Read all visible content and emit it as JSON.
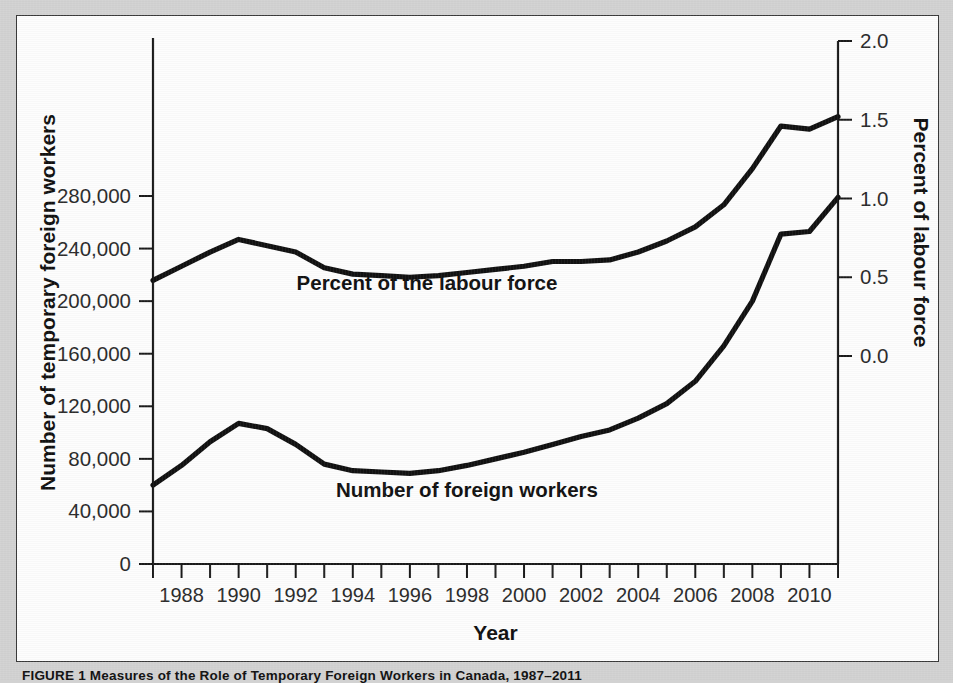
{
  "figure": {
    "caption": "FIGURE 1   Measures of the Role of Temporary Foreign Workers in Canada, 1987–2011"
  },
  "chart_data": {
    "type": "line",
    "title": "",
    "xlabel": "Year",
    "ylabel": "Number of temporary foreign workers",
    "y2label": "Percent of labour force",
    "xlim": [
      1987,
      2011
    ],
    "ylim": [
      0,
      300000
    ],
    "y2lim": [
      -0.5,
      2.0
    ],
    "grid": false,
    "legend": "inline-labels",
    "x": [
      1987,
      1988,
      1989,
      1990,
      1991,
      1992,
      1993,
      1994,
      1995,
      1996,
      1997,
      1998,
      1999,
      2000,
      2001,
      2002,
      2003,
      2004,
      2005,
      2006,
      2007,
      2008,
      2009,
      2010,
      2011
    ],
    "xticks": [
      1987,
      1988,
      1989,
      1990,
      1991,
      1992,
      1993,
      1994,
      1995,
      1996,
      1997,
      1998,
      1999,
      2000,
      2001,
      2002,
      2003,
      2004,
      2005,
      2006,
      2007,
      2008,
      2009,
      2010,
      2011
    ],
    "xtick_labels": [
      "",
      "1988",
      "",
      "1990",
      "",
      "1992",
      "",
      "1994",
      "",
      "1996",
      "",
      "1998",
      "",
      "2000",
      "",
      "2002",
      "",
      "2004",
      "",
      "2006",
      "",
      "2008",
      "",
      "2010",
      ""
    ],
    "yticks": [
      0,
      40000,
      80000,
      120000,
      160000,
      200000,
      240000,
      280000
    ],
    "ytick_labels": [
      "0",
      "40,000",
      "80,000",
      "120,000",
      "160,000",
      "200,000",
      "240,000",
      "280,000"
    ],
    "y2ticks": [
      0.0,
      0.5,
      1.0,
      1.5,
      2.0
    ],
    "y2tick_labels": [
      "0.0",
      "0.5",
      "1.0",
      "1.5",
      "2.0"
    ],
    "series": [
      {
        "name": "Percent of the labour force",
        "axis": "right",
        "label_text": "Percent of the labour force",
        "values": [
          0.48,
          0.57,
          0.66,
          0.74,
          0.7,
          0.66,
          0.56,
          0.52,
          0.51,
          0.5,
          0.51,
          0.53,
          0.55,
          0.57,
          0.6,
          0.6,
          0.61,
          0.66,
          0.73,
          0.82,
          0.96,
          1.19,
          1.46,
          1.44,
          1.52
        ]
      },
      {
        "name": "Number of foreign workers",
        "axis": "left",
        "label_text": "Number of foreign workers",
        "values": [
          60000,
          75000,
          93000,
          107000,
          103000,
          91000,
          76000,
          71000,
          70000,
          69000,
          71000,
          75000,
          80000,
          85000,
          91000,
          97000,
          102000,
          111000,
          122000,
          139000,
          166000,
          200000,
          251000,
          253000,
          279000
        ]
      }
    ],
    "annotations": [
      {
        "text": "Percent of the labour force",
        "x": 1995.0,
        "series": "percent"
      },
      {
        "text": "Number of foreign workers",
        "x": 1997.0,
        "series": "number"
      }
    ],
    "colors": {
      "line": "#111111",
      "axis": "#1a1a1a",
      "panel_background": "#fdfdfd",
      "page_background": "#d2d2d2"
    }
  }
}
